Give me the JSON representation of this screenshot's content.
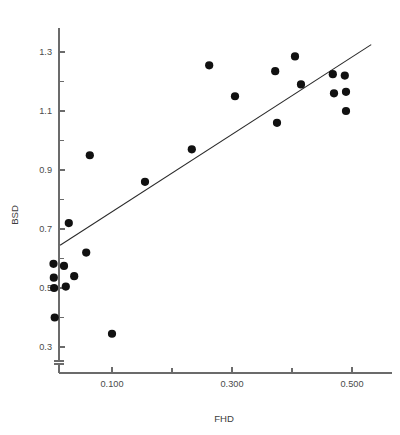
{
  "chart_data": {
    "type": "scatter",
    "title": "",
    "xlabel": "FHD",
    "ylabel": "BSD",
    "xlim": [
      0.0,
      0.565
    ],
    "ylim": [
      0.23,
      1.4
    ],
    "grid": false,
    "legend": null,
    "x_ticks_major": [
      0.1,
      0.3,
      0.5
    ],
    "x_ticks_major_labels": [
      "0.100",
      "0.300",
      "0.500"
    ],
    "x_ticks_minor": [
      0.2,
      0.4
    ],
    "y_ticks_major": [
      0.3,
      0.5,
      0.7,
      0.9,
      1.1,
      1.3
    ],
    "y_ticks_major_labels": [
      "0.3",
      "0.5",
      "0.7",
      "0.9",
      "1.1",
      "1.3"
    ],
    "y_ticks_minor": [
      0.4,
      0.6,
      0.8,
      1.0,
      1.2
    ],
    "points": [
      {
        "x": 0.0025,
        "y": 0.582
      },
      {
        "x": 0.003,
        "y": 0.535
      },
      {
        "x": 0.02,
        "y": 0.575
      },
      {
        "x": 0.0035,
        "y": 0.5
      },
      {
        "x": 0.023,
        "y": 0.505
      },
      {
        "x": 0.037,
        "y": 0.54
      },
      {
        "x": 0.0045,
        "y": 0.4
      },
      {
        "x": 0.028,
        "y": 0.72
      },
      {
        "x": 0.057,
        "y": 0.62
      },
      {
        "x": 0.063,
        "y": 0.95
      },
      {
        "x": 0.1,
        "y": 0.345
      },
      {
        "x": 0.155,
        "y": 0.86
      },
      {
        "x": 0.233,
        "y": 0.97
      },
      {
        "x": 0.262,
        "y": 1.255
      },
      {
        "x": 0.305,
        "y": 1.15
      },
      {
        "x": 0.375,
        "y": 1.06
      },
      {
        "x": 0.372,
        "y": 1.235
      },
      {
        "x": 0.405,
        "y": 1.285
      },
      {
        "x": 0.415,
        "y": 1.19
      },
      {
        "x": 0.468,
        "y": 1.225
      },
      {
        "x": 0.47,
        "y": 1.16
      },
      {
        "x": 0.49,
        "y": 1.1
      },
      {
        "x": 0.488,
        "y": 1.22
      },
      {
        "x": 0.49,
        "y": 1.165
      }
    ],
    "fit_line": {
      "x_start": 0.0135,
      "y_start": 0.645,
      "x_end": 0.532,
      "y_end": 1.325
    },
    "marker_radius_px": 4.1,
    "colors": {
      "point": "#111111",
      "line": "#2a2a2a",
      "axis": "#6b6b6b",
      "label": "#3d3d3d",
      "background": "#ffffff"
    }
  }
}
